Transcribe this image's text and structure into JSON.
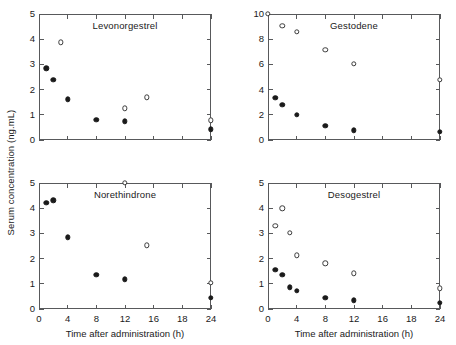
{
  "figure": {
    "ylabel": "Serum concentration (ng.mL)",
    "xlabel": "Time after administration (h)",
    "marker_colors": {
      "filled": "#1a1a1a",
      "open_edge": "#3a3a3a",
      "axis": "#58595b"
    }
  },
  "chart_data": [
    {
      "type": "scatter",
      "title": "Levonorgestrel",
      "panel": "top-left",
      "xlabel": "",
      "ylabel": "Serum concentration (ng.mL)",
      "xlim": [
        0,
        24
      ],
      "ylim": [
        0,
        5
      ],
      "xticks": [
        0,
        4,
        8,
        12,
        16,
        20,
        24
      ],
      "xticklabels": [
        "",
        "",
        "",
        "",
        "",
        "",
        ""
      ],
      "yticks": [
        0,
        1,
        2,
        3,
        4,
        5
      ],
      "yticklabels": [
        "0",
        "1",
        "2",
        "3",
        "4",
        "5"
      ],
      "grid": false,
      "legend": null,
      "series": [
        {
          "name": "filled-circles",
          "marker": "filled",
          "points": [
            {
              "x": 1.0,
              "y": 2.85
            },
            {
              "x": 2.0,
              "y": 2.38
            },
            {
              "x": 4.0,
              "y": 1.62
            },
            {
              "x": 8.0,
              "y": 0.81
            },
            {
              "x": 12.0,
              "y": 0.74
            },
            {
              "x": 24.0,
              "y": 0.42
            }
          ]
        },
        {
          "name": "open-circles",
          "marker": "open",
          "points": [
            {
              "x": 3.0,
              "y": 3.88
            },
            {
              "x": 12.0,
              "y": 1.26
            },
            {
              "x": 15.0,
              "y": 1.69
            },
            {
              "x": 24.0,
              "y": 0.78
            }
          ]
        }
      ]
    },
    {
      "type": "scatter",
      "title": "Gestodene",
      "panel": "top-right",
      "xlabel": "",
      "ylabel": "",
      "xlim": [
        0,
        24
      ],
      "ylim": [
        0,
        10
      ],
      "xticks": [
        0,
        4,
        8,
        12,
        16,
        20,
        24
      ],
      "xticklabels": [
        "",
        "",
        "",
        "",
        "",
        "",
        ""
      ],
      "yticks": [
        0,
        2,
        4,
        6,
        8,
        10
      ],
      "yticklabels": [
        "0",
        "2",
        "4",
        "6",
        "8",
        "10"
      ],
      "grid": false,
      "legend": null,
      "series": [
        {
          "name": "filled-circles",
          "marker": "filled",
          "points": [
            {
              "x": 1.0,
              "y": 3.35
            },
            {
              "x": 2.0,
              "y": 2.8
            },
            {
              "x": 4.0,
              "y": 2.02
            },
            {
              "x": 8.0,
              "y": 1.12
            },
            {
              "x": 12.0,
              "y": 0.78
            },
            {
              "x": 24.0,
              "y": 0.65
            }
          ]
        },
        {
          "name": "open-circles",
          "marker": "open",
          "points": [
            {
              "x": 0.0,
              "y": 10.0
            },
            {
              "x": 2.0,
              "y": 9.08
            },
            {
              "x": 4.0,
              "y": 8.58
            },
            {
              "x": 8.0,
              "y": 7.15
            },
            {
              "x": 12.0,
              "y": 6.05
            },
            {
              "x": 24.0,
              "y": 4.78
            }
          ]
        }
      ]
    },
    {
      "type": "scatter",
      "title": "Norethindrone",
      "panel": "bottom-left",
      "xlabel": "Time after administration (h)",
      "ylabel": "Serum concentration (ng.mL)",
      "xlim": [
        0,
        24
      ],
      "ylim": [
        0,
        5
      ],
      "xticks": [
        0,
        4,
        8,
        12,
        16,
        20,
        24
      ],
      "xticklabels": [
        "0",
        "4",
        "8",
        "12",
        "16",
        "18",
        "24"
      ],
      "yticks": [
        0,
        1,
        2,
        3,
        4,
        5
      ],
      "yticklabels": [
        "0",
        "1",
        "2",
        "3",
        "4",
        "5"
      ],
      "grid": false,
      "legend": null,
      "series": [
        {
          "name": "filled-circles",
          "marker": "filled",
          "points": [
            {
              "x": 1.0,
              "y": 4.21
            },
            {
              "x": 2.0,
              "y": 4.32
            },
            {
              "x": 4.0,
              "y": 2.85
            },
            {
              "x": 8.0,
              "y": 1.36
            },
            {
              "x": 12.0,
              "y": 1.18
            },
            {
              "x": 24.0,
              "y": 0.45
            }
          ]
        },
        {
          "name": "open-circles",
          "marker": "open",
          "points": [
            {
              "x": 12.0,
              "y": 5.02
            },
            {
              "x": 15.0,
              "y": 2.52
            },
            {
              "x": 24.0,
              "y": 1.05
            }
          ]
        }
      ]
    },
    {
      "type": "scatter",
      "title": "Desogestrel",
      "panel": "bottom-right",
      "xlabel": "Time after administration (h)",
      "ylabel": "",
      "xlim": [
        0,
        24
      ],
      "ylim": [
        0,
        5
      ],
      "xticks": [
        0,
        4,
        8,
        12,
        16,
        20,
        24
      ],
      "xticklabels": [
        "0",
        "4",
        "8",
        "12",
        "16",
        "18",
        "24"
      ],
      "yticks": [
        0,
        1,
        2,
        3,
        4,
        5
      ],
      "yticklabels": [
        "0",
        "1",
        "2",
        "3",
        "4",
        "5"
      ],
      "grid": false,
      "legend": null,
      "series": [
        {
          "name": "filled-circles",
          "marker": "filled",
          "points": [
            {
              "x": 1.0,
              "y": 1.55
            },
            {
              "x": 2.0,
              "y": 1.35
            },
            {
              "x": 3.0,
              "y": 0.86
            },
            {
              "x": 4.0,
              "y": 0.71
            },
            {
              "x": 8.0,
              "y": 0.44
            },
            {
              "x": 12.0,
              "y": 0.35
            },
            {
              "x": 24.0,
              "y": 0.25
            }
          ]
        },
        {
          "name": "open-circles",
          "marker": "open",
          "points": [
            {
              "x": 1.0,
              "y": 3.3
            },
            {
              "x": 2.0,
              "y": 3.99
            },
            {
              "x": 3.0,
              "y": 3.02
            },
            {
              "x": 4.0,
              "y": 2.13
            },
            {
              "x": 8.0,
              "y": 1.82
            },
            {
              "x": 12.0,
              "y": 1.41
            },
            {
              "x": 24.0,
              "y": 0.82
            }
          ]
        }
      ]
    }
  ]
}
